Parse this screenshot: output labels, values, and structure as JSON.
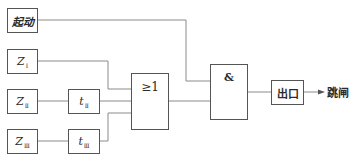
{
  "diagram": {
    "title": "",
    "blocks": {
      "start": {
        "label": "起动"
      },
      "z1": {
        "label": "Z",
        "sub": "Ⅰ"
      },
      "z2": {
        "label": "Z",
        "sub": "Ⅱ"
      },
      "z3": {
        "label": "Z",
        "sub": "Ⅲ"
      },
      "t2": {
        "label": "t",
        "sub": "Ⅱ"
      },
      "t3": {
        "label": "t",
        "sub": "Ⅲ"
      },
      "or_gate": {
        "label": "≥1"
      },
      "and_gate": {
        "label": "&"
      },
      "output": {
        "label": "出口"
      }
    },
    "result": {
      "label": "跳闸"
    },
    "connections": [
      {
        "from": "start",
        "to": "and_gate"
      },
      {
        "from": "z1",
        "to": "or_gate"
      },
      {
        "from": "z2",
        "to": "t2"
      },
      {
        "from": "t2",
        "to": "or_gate"
      },
      {
        "from": "z3",
        "to": "t3"
      },
      {
        "from": "t3",
        "to": "or_gate"
      },
      {
        "from": "or_gate",
        "to": "and_gate"
      },
      {
        "from": "and_gate",
        "to": "output"
      },
      {
        "from": "output",
        "to": "result"
      }
    ],
    "colors": {
      "line": "#7a7a7a",
      "box_border": "#555555",
      "text": "#2b2b2b"
    }
  }
}
